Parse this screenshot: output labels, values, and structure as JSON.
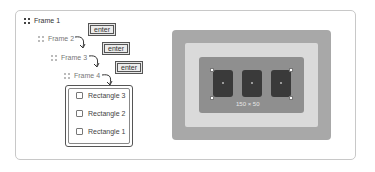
{
  "layers": {
    "frame1": "Frame 1",
    "frame2": "Frame 2",
    "frame3": "Frame 3",
    "frame4": "Frame 4",
    "children": [
      "Rectangle 3",
      "Rectangle 2",
      "Rectangle 1"
    ]
  },
  "enter_buttons": [
    "enter",
    "enter",
    "enter"
  ],
  "canvas": {
    "selection_size": "150 × 50",
    "colors": {
      "outer_frame": "#a8a8a8",
      "middle_frame": "#dadada",
      "inner_frame": "#8f8f8f",
      "rectangle": "#3a3a3a"
    }
  },
  "icons": {
    "frame": "frame-grid-icon",
    "rectangle": "rectangle-icon",
    "arrow": "curved-arrow-icon"
  }
}
